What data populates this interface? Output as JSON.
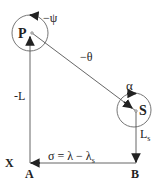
{
  "diagram": {
    "colors": {
      "stroke": "#555555",
      "text": "#222222",
      "background": "#ffffff"
    },
    "nodes": {
      "P": {
        "label": "P"
      },
      "S": {
        "label": "S"
      },
      "A": {
        "label": "A"
      },
      "B": {
        "label": "B"
      },
      "X": {
        "label": "X"
      }
    },
    "labels": {
      "psi": "−ψ",
      "theta": "−θ",
      "alpha": "α",
      "L": "-L",
      "Ls_main": "L",
      "Ls_sub": "s",
      "sigma_main": "σ = λ − λ",
      "sigma_sub": "s"
    }
  }
}
